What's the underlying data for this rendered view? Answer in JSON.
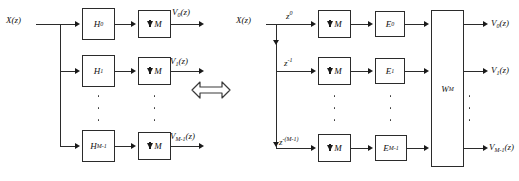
{
  "diagram": {
    "equivalence_symbol": "double-headed-arrow"
  },
  "left": {
    "input_label": "X(z)",
    "branches": [
      {
        "filter": "H",
        "filter_sub": "0",
        "downsampler": "M",
        "output": "V",
        "output_sub": "0",
        "output_arg": "(z)"
      },
      {
        "filter": "H",
        "filter_sub": "1",
        "downsampler": "M",
        "output": "V",
        "output_sub": "1",
        "output_arg": "(z)"
      },
      {
        "filter": "H",
        "filter_sub": "M-1",
        "downsampler": "M",
        "output": "V",
        "output_sub": "M-1",
        "output_arg": "(z)"
      }
    ],
    "down_arrow_glyph": "down-arrow-icon"
  },
  "right": {
    "input_label": "X(z)",
    "matrix_label": "W",
    "matrix_sub": "M",
    "branches": [
      {
        "delay_base": "z",
        "delay_exp": "0",
        "downsampler": "M",
        "poly": "E",
        "poly_sub": "0",
        "output": "V",
        "output_sub": "0",
        "output_arg": "(z)"
      },
      {
        "delay_base": "z",
        "delay_exp": "-1",
        "downsampler": "M",
        "poly": "E",
        "poly_sub": "1",
        "output": "V",
        "output_sub": "1",
        "output_arg": "(z)"
      },
      {
        "delay_base": "z",
        "delay_exp": "-(M-1)",
        "downsampler": "M",
        "poly": "E",
        "poly_sub": "M-1",
        "output": "V",
        "output_sub": "M-1",
        "output_arg": "(z)"
      }
    ]
  },
  "colors": {
    "line": "#2b2b2b",
    "text": "#111111",
    "background": "#ffffff"
  }
}
